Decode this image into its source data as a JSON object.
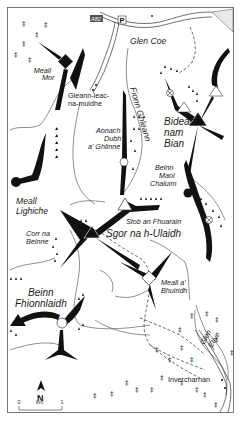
{
  "map": {
    "title": "Glen Coe / Glen Etive hills",
    "road_label": "A82",
    "parking_label": "P",
    "north_label": "N",
    "scale": {
      "start": "0",
      "unit": "km",
      "end": "1"
    },
    "labels": {
      "glen_coe": "Glen Coe",
      "meall_mor_1": "Meall",
      "meall_mor_2": "Mor",
      "gleann_1": "Gleann-leac-",
      "gleann_2": "na-muidhe",
      "fionn_ghleann": "Fionn Ghleann",
      "aonach_1": "Aonach",
      "aonach_2": "Dubh",
      "aonach_3": "a' Ghlinne",
      "bidean_1": "Bidean",
      "bidean_2": "nam",
      "bidean_3": "Bian",
      "beinn_maol_1": "Beinn",
      "beinn_maol_2": "Maol",
      "beinn_maol_3": "Chaluim",
      "meall_lighiche_1": "Meall",
      "meall_lighiche_2": "Lighiche",
      "stob": "Stob an Fhuarain",
      "corr_1": "Corr na",
      "corr_2": "Beinne",
      "sgor": "Sgor na h-Ulaidh",
      "meall_bhuiridh_1": "Meall a'",
      "meall_bhuiridh_2": "Bhuiridh",
      "beinn_fhionn_1": "Beinn",
      "beinn_fhionn_2": "Fhionnlaidh",
      "glen_etive_1": "Glen",
      "glen_etive_2": "Etive",
      "invercharnan": "Invercharnan"
    },
    "colors": {
      "ridge": "#111111",
      "frame": "#555555",
      "background": "#ffffff"
    }
  }
}
